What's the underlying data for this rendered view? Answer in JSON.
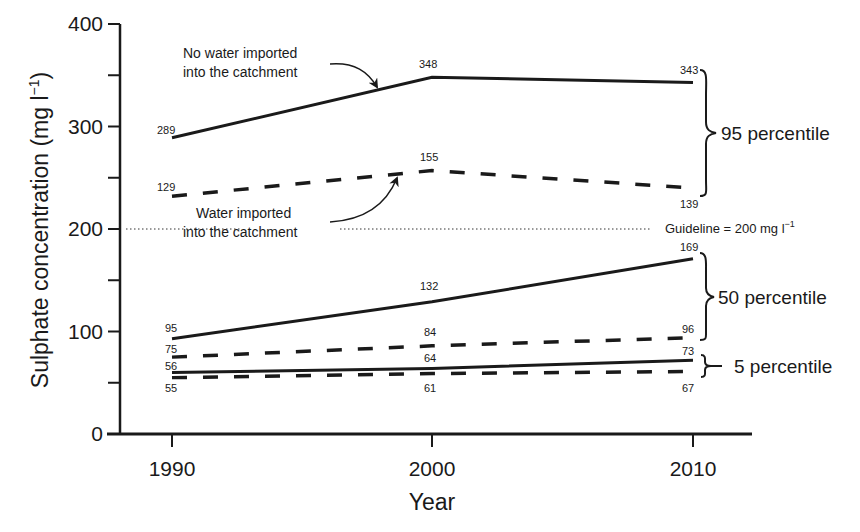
{
  "chart_data": {
    "type": "line",
    "title": "",
    "xlabel": "Year",
    "ylabel": "Sulphate concentration  (mg l⁻¹)",
    "ylabel_main": "Sulphate concentration  (mg l",
    "ylabel_sup": "−1",
    "ylabel_close": ")",
    "x": [
      1990,
      2000,
      2010
    ],
    "x_tick_labels": [
      "1990",
      "2000",
      "2010"
    ],
    "ylim": [
      0,
      400
    ],
    "y_ticks": [
      0,
      100,
      200,
      300,
      400
    ],
    "y_minor_ticks": [
      50,
      150,
      250,
      350
    ],
    "grid": false,
    "guideline": {
      "value": 200,
      "label": "Guideline = 200 mg l",
      "label_sup": "−1",
      "style": "dotted"
    },
    "series": [
      {
        "name": "95 percentile - No water imported into the catchment",
        "group": "95 percentile",
        "style": "solid",
        "values": [
          289,
          348,
          343
        ],
        "plot_y": [
          289,
          348,
          343
        ]
      },
      {
        "name": "95 percentile - Water imported into the catchment",
        "group": "95 percentile",
        "style": "dashed",
        "values": [
          129,
          155,
          139
        ],
        "plot_y": [
          232,
          257,
          240
        ]
      },
      {
        "name": "50 percentile - No water imported into the catchment",
        "group": "50 percentile",
        "style": "solid",
        "values": [
          95,
          132,
          169
        ],
        "plot_y": [
          93,
          129,
          171
        ]
      },
      {
        "name": "50 percentile - Water imported into the catchment",
        "group": "50 percentile",
        "style": "dashed",
        "values": [
          75,
          84,
          96
        ],
        "plot_y": [
          75,
          86,
          94
        ]
      },
      {
        "name": "5 percentile - No water imported into the catchment",
        "group": "5 percentile",
        "style": "solid",
        "values": [
          56,
          64,
          73
        ],
        "plot_y": [
          60,
          64,
          72
        ]
      },
      {
        "name": "5 percentile - Water imported into the catchment",
        "group": "5 percentile",
        "style": "dashed",
        "values": [
          55,
          61,
          67
        ],
        "plot_y": [
          55,
          59,
          61
        ]
      }
    ],
    "annotations": [
      {
        "text_lines": [
          "No water imported",
          "into the catchment"
        ],
        "points_to": "95 percentile solid line"
      },
      {
        "text_lines": [
          "Water imported",
          "into the catchment"
        ],
        "points_to": "95 percentile dashed line"
      }
    ],
    "group_labels": [
      "95 percentile",
      "50 percentile",
      "5 percentile"
    ]
  }
}
